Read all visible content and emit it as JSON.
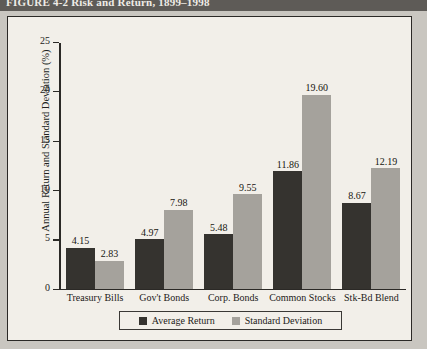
{
  "figure": {
    "title": "FIGURE 4-2  Risk and Return, 1899–1998"
  },
  "chart_data": {
    "type": "bar",
    "title": "Risk and Return, 1899–1998",
    "xlabel": "",
    "ylabel": "Annual Return and Standard Deviation (%)",
    "ylim": [
      0,
      25
    ],
    "yticks": [
      "0",
      "5",
      "10",
      "15",
      "20",
      "25"
    ],
    "grid": false,
    "legend_position": "bottom",
    "categories": [
      "Treasury Bills",
      "Gov't Bonds",
      "Corp. Bonds",
      "Common Stocks",
      "Stk-Bd Blend"
    ],
    "series": [
      {
        "name": "Average Return",
        "color": "#35332f",
        "values": [
          4.15,
          4.97,
          5.48,
          11.86,
          8.67
        ],
        "labels": [
          "4.15",
          "4.97",
          "5.48",
          "11.86",
          "8.67"
        ]
      },
      {
        "name": "Standard Deviation",
        "color": "#a5a29c",
        "values": [
          2.83,
          7.98,
          9.55,
          19.6,
          12.19
        ],
        "labels": [
          "2.83",
          "7.98",
          "9.55",
          "19.60",
          "12.19"
        ]
      }
    ]
  }
}
